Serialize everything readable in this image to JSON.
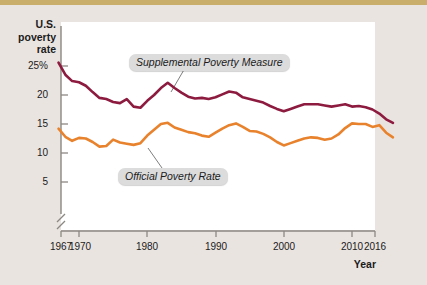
{
  "figure": {
    "y_axis_title": "U.S. poverty rate",
    "x_axis_title": "Year"
  },
  "chart_data": {
    "type": "line",
    "title": "",
    "xlabel": "Year",
    "ylabel": "U.S. poverty rate",
    "xlim": [
      1967,
      2016
    ],
    "ylim": [
      4,
      26
    ],
    "y_axis_break": true,
    "grid": false,
    "legend_position": "inline-callouts",
    "x_tick_labels": [
      "1967",
      "1970",
      "1980",
      "1990",
      "2000",
      "2010",
      "2016"
    ],
    "x_ticks": [
      1967,
      1970,
      1980,
      1990,
      2000,
      2010,
      2016
    ],
    "y_tick_labels": [
      "25%",
      "20",
      "15",
      "10",
      "5"
    ],
    "y_ticks": [
      25,
      20,
      15,
      10,
      5
    ],
    "x": [
      1967,
      1968,
      1969,
      1970,
      1971,
      1972,
      1973,
      1974,
      1975,
      1976,
      1977,
      1978,
      1979,
      1980,
      1981,
      1982,
      1983,
      1984,
      1985,
      1986,
      1987,
      1988,
      1989,
      1990,
      1991,
      1992,
      1993,
      1994,
      1995,
      1996,
      1997,
      1998,
      1999,
      2000,
      2001,
      2002,
      2003,
      2004,
      2005,
      2006,
      2007,
      2008,
      2009,
      2010,
      2011,
      2012,
      2013,
      2014,
      2015,
      2016
    ],
    "series": [
      {
        "name": "Supplemental Poverty Measure",
        "color": "#8d1b40",
        "values": [
          25.6,
          23.5,
          22.4,
          22.2,
          21.6,
          20.5,
          19.5,
          19.3,
          18.8,
          18.6,
          19.3,
          18.0,
          17.8,
          19.0,
          20.0,
          21.2,
          22.1,
          21.2,
          20.4,
          19.7,
          19.4,
          19.5,
          19.3,
          19.6,
          20.1,
          20.6,
          20.4,
          19.6,
          19.3,
          19.0,
          18.7,
          18.1,
          17.6,
          17.2,
          17.6,
          18.0,
          18.4,
          18.4,
          18.4,
          18.2,
          18.0,
          18.2,
          18.4,
          18.0,
          18.1,
          17.9,
          17.5,
          16.8,
          15.8,
          15.2
        ],
        "callout_label": "Supplemental Poverty Measure"
      },
      {
        "name": "Official Poverty Rate",
        "color": "#e8822c",
        "values": [
          14.2,
          12.8,
          12.1,
          12.6,
          12.5,
          11.9,
          11.1,
          11.2,
          12.3,
          11.8,
          11.6,
          11.4,
          11.7,
          13.0,
          14.0,
          15.0,
          15.2,
          14.4,
          14.0,
          13.6,
          13.4,
          13.0,
          12.8,
          13.5,
          14.2,
          14.8,
          15.1,
          14.5,
          13.8,
          13.7,
          13.3,
          12.7,
          11.9,
          11.3,
          11.7,
          12.1,
          12.5,
          12.7,
          12.6,
          12.3,
          12.5,
          13.2,
          14.3,
          15.1,
          15.0,
          15.0,
          14.5,
          14.8,
          13.5,
          12.7
        ],
        "callout_label": "Official Poverty Rate"
      }
    ]
  }
}
